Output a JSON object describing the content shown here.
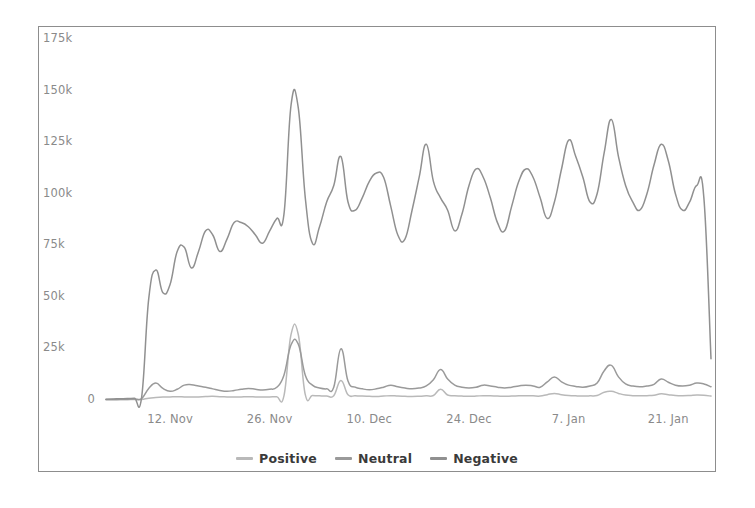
{
  "chart_data": {
    "type": "line",
    "title": "",
    "subtitle": "",
    "xlabel": "",
    "ylabel": "",
    "grid": false,
    "legend_position": "bottom-center",
    "ylim": [
      0,
      175000
    ],
    "ytick_labels": [
      "0",
      "25k",
      "50k",
      "75k",
      "100k",
      "125k",
      "150k",
      "175k"
    ],
    "ytick_values": [
      0,
      25000,
      50000,
      75000,
      100000,
      125000,
      150000,
      175000
    ],
    "xtick_labels": [
      "12. Nov",
      "26. Nov",
      "10. Dec",
      "24. Dec",
      "7. Jan",
      "21. Jan"
    ],
    "xtick_indices": [
      9,
      23,
      37,
      51,
      65,
      79
    ],
    "x_count": 86,
    "series": [
      {
        "name": "Positive",
        "color": "#b9b9b9",
        "values": [
          120,
          140,
          160,
          180,
          200,
          220,
          900,
          1200,
          1400,
          1500,
          1600,
          1500,
          1400,
          1500,
          1700,
          1800,
          1600,
          1500,
          1400,
          1500,
          1600,
          1500,
          1400,
          1500,
          1600,
          2000,
          31800,
          32000,
          2600,
          2200,
          2000,
          1900,
          2100,
          9500,
          2500,
          2100,
          1900,
          1800,
          1700,
          1900,
          2100,
          1900,
          1800,
          1700,
          1800,
          2000,
          2200,
          5200,
          2400,
          2100,
          1900,
          1800,
          1900,
          2100,
          2000,
          1900,
          1800,
          1900,
          2000,
          2100,
          2000,
          1900,
          2600,
          3200,
          2600,
          2200,
          2000,
          1900,
          2000,
          2200,
          3800,
          4200,
          3200,
          2400,
          2100,
          2000,
          2100,
          2300,
          3000,
          2600,
          2200,
          2100,
          2200,
          2400,
          2300,
          1900
        ]
      },
      {
        "name": "Neutral",
        "color": "#9a9a9a",
        "values": [
          200,
          260,
          320,
          420,
          520,
          700,
          5600,
          8200,
          5600,
          4200,
          5200,
          7200,
          7400,
          6800,
          6200,
          5400,
          4600,
          4200,
          4600,
          5200,
          5600,
          5200,
          4800,
          5200,
          6200,
          12000,
          26800,
          27200,
          12000,
          7200,
          5800,
          5400,
          6200,
          24800,
          9200,
          6200,
          5400,
          5000,
          5400,
          6200,
          7200,
          6400,
          5800,
          5400,
          5800,
          6800,
          9800,
          14800,
          10200,
          7200,
          6200,
          5800,
          6200,
          7200,
          6800,
          6200,
          5800,
          6200,
          6800,
          7200,
          6800,
          6200,
          8800,
          11200,
          8800,
          7200,
          6600,
          6200,
          6800,
          8200,
          14200,
          16800,
          11200,
          7800,
          6800,
          6400,
          6800,
          7600,
          10200,
          8600,
          7200,
          6800,
          7200,
          8200,
          7800,
          6400
        ]
      },
      {
        "name": "Negative",
        "color": "#909090",
        "values": [
          400,
          500,
          600,
          700,
          900,
          1200,
          49000,
          63000,
          52000,
          56000,
          72000,
          74000,
          64000,
          72000,
          82000,
          80000,
          72000,
          78000,
          86000,
          86000,
          84000,
          80000,
          76000,
          82000,
          88000,
          90000,
          143000,
          142000,
          98000,
          76000,
          84000,
          96000,
          104000,
          118000,
          96000,
          92000,
          98000,
          106000,
          110000,
          108000,
          94000,
          80000,
          78000,
          92000,
          108000,
          124000,
          106000,
          98000,
          92000,
          82000,
          90000,
          104000,
          112000,
          108000,
          98000,
          86000,
          82000,
          94000,
          106000,
          112000,
          108000,
          98000,
          88000,
          96000,
          112000,
          126000,
          118000,
          108000,
          96000,
          100000,
          120000,
          136000,
          118000,
          104000,
          96000,
          92000,
          100000,
          114000,
          124000,
          116000,
          100000,
          92000,
          96000,
          104000,
          98000,
          20000
        ]
      }
    ]
  },
  "legend": {
    "items": [
      {
        "label": "Positive",
        "color": "#b9b9b9"
      },
      {
        "label": "Neutral",
        "color": "#9a9a9a"
      },
      {
        "label": "Negative",
        "color": "#909090"
      }
    ]
  },
  "frame": {
    "border_color": "#8d8d8d",
    "background": "#ffffff",
    "tick_text_color": "#8a8a8a",
    "legend_text_color": "#3a3a3a"
  }
}
